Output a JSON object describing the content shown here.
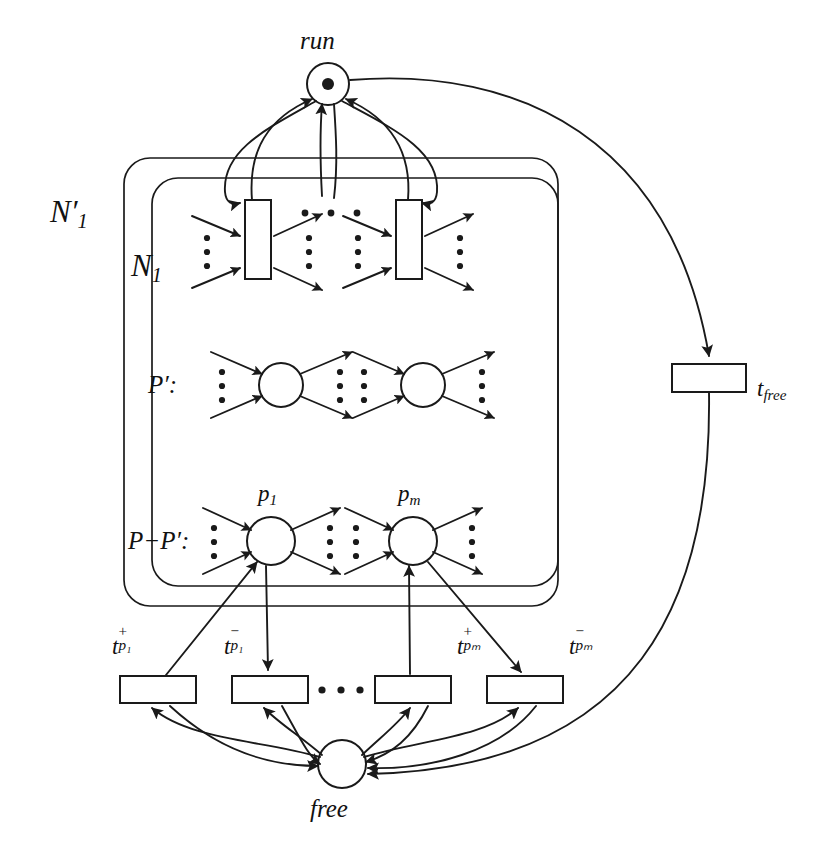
{
  "figure": {
    "kind": "petri-net-diagram",
    "width": 835,
    "height": 852,
    "stroke_color": "#1a1a1a",
    "fill_color": "#ffffff",
    "background": "#ffffff"
  },
  "labels": {
    "run_place": "run",
    "free_place": "free",
    "outer_net": "N",
    "outer_net_sub": "1",
    "outer_net_prime": "′",
    "inner_net": "N",
    "inner_net_sub": "1",
    "p_prime_set": "P′:",
    "p_minus_p_prime_set": "P−P′:",
    "place_p1": "p",
    "place_p1_sub": "1",
    "place_pm": "p",
    "place_pm_sub": "m",
    "t_free": "t",
    "t_free_sub": "free",
    "t_plus_p1": "t",
    "t_plus_p1_sup": "+",
    "t_plus_p1_sub": "p₁",
    "t_minus_p1": "t",
    "t_minus_p1_sup": "−",
    "t_minus_p1_sub": "p₁",
    "t_plus_pm": "t",
    "t_plus_pm_sup": "+",
    "t_plus_pm_sub": "pₘ",
    "t_minus_pm": "t",
    "t_minus_pm_sup": "−",
    "t_minus_pm_sub": "pₘ"
  },
  "nodes": {
    "run": {
      "type": "place",
      "cx": 328,
      "cy": 84,
      "r": 21,
      "tokens": 1,
      "token_r": 6
    },
    "free": {
      "type": "place",
      "cx": 342,
      "cy": 764,
      "r": 24,
      "tokens": 0
    },
    "inner_transition_left": {
      "type": "transition",
      "x": 245,
      "y": 200,
      "w": 26,
      "h": 79
    },
    "inner_transition_right": {
      "type": "transition",
      "x": 396,
      "y": 200,
      "w": 26,
      "h": 79
    },
    "pprime_place_left": {
      "type": "place",
      "cx": 281,
      "cy": 385,
      "r": 22
    },
    "pprime_place_right": {
      "type": "place",
      "cx": 423,
      "cy": 385,
      "r": 22
    },
    "p1": {
      "type": "place",
      "cx": 271,
      "cy": 541,
      "r": 24
    },
    "pm": {
      "type": "place",
      "cx": 413,
      "cy": 541,
      "r": 24
    },
    "t_free": {
      "type": "transition",
      "x": 672,
      "y": 364,
      "w": 74,
      "h": 28
    },
    "t_plus_p1": {
      "type": "transition",
      "x": 120,
      "y": 676,
      "w": 76,
      "h": 27
    },
    "t_minus_p1": {
      "type": "transition",
      "x": 232,
      "y": 676,
      "w": 76,
      "h": 27
    },
    "t_plus_pm": {
      "type": "transition",
      "x": 375,
      "y": 676,
      "w": 76,
      "h": 27
    },
    "t_minus_pm": {
      "type": "transition",
      "x": 487,
      "y": 676,
      "w": 76,
      "h": 27
    }
  },
  "boxes": {
    "outer_net_box": {
      "x": 124,
      "y": 158,
      "w": 434,
      "h": 448,
      "rx": 26
    },
    "inner_net_box": {
      "x": 152,
      "y": 178,
      "w": 406,
      "h": 408,
      "rx": 26
    }
  },
  "ellipses": {
    "top_row": {
      "cx": 330,
      "cy": 213,
      "count": 3,
      "spacing": 25,
      "r": 3.2
    },
    "bottom_transitions": {
      "cx": 341,
      "cy": 690,
      "count": 3,
      "spacing": 25,
      "r": 3.4
    },
    "vertical_groups": "three stacked dots shown left and right of each place and transition"
  },
  "colors": {
    "ink": "#1a1a1a",
    "paper": "#ffffff"
  }
}
